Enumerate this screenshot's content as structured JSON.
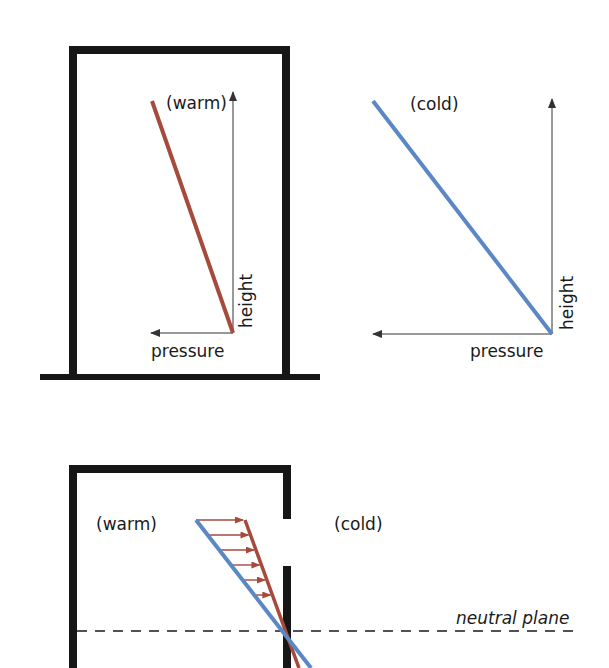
{
  "colors": {
    "warm": "#a64a3c",
    "cold": "#5b87c5",
    "wall": "#161616",
    "axis": "#333333"
  },
  "panel_top_left": {
    "condition_label": "(warm)",
    "x_axis_label": "pressure",
    "y_axis_label": "height"
  },
  "panel_top_right": {
    "condition_label": "(cold)",
    "x_axis_label": "pressure",
    "y_axis_label": "height"
  },
  "panel_bottom": {
    "inside_label": "(warm)",
    "outside_label": "(cold)",
    "neutral_plane_label": "neutral plane",
    "pressure_arrow_count": 6
  }
}
